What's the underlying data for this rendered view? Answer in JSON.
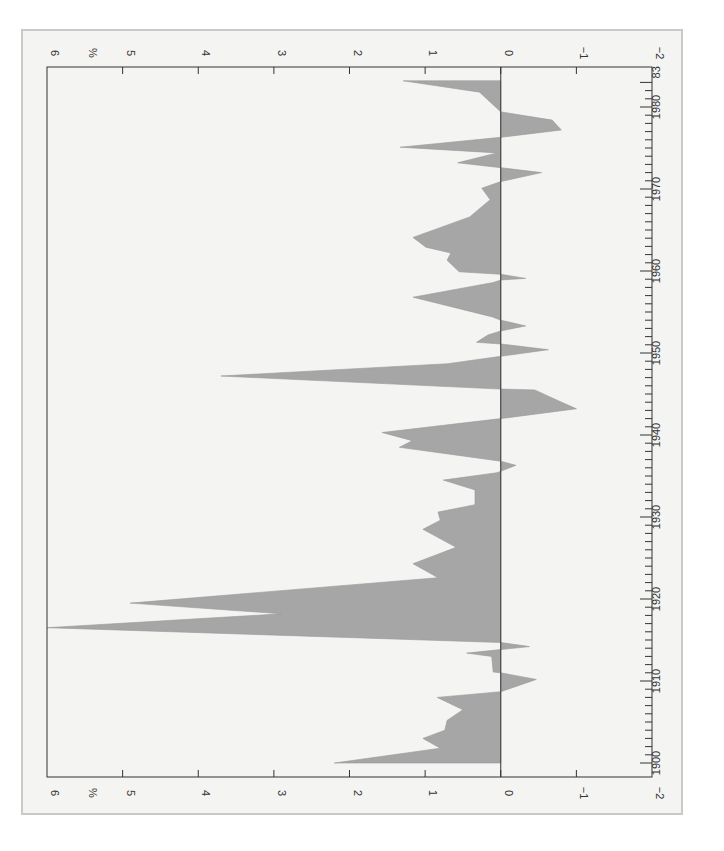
{
  "chart_data": {
    "type": "area",
    "orientation": "rotated-90-clockwise",
    "title": "",
    "xlabel": "",
    "ylabel": "%",
    "x_range": [
      1900,
      1983
    ],
    "ylim": [
      -2,
      6
    ],
    "grid": false,
    "legend": null,
    "value_ticks": [
      "6",
      "%",
      "5",
      "4",
      "3",
      "2",
      "1",
      "0",
      "−1",
      "−2"
    ],
    "value_tick_values": [
      6,
      5,
      4,
      3,
      2,
      1,
      0,
      -1,
      -2
    ],
    "year_tick_labels": [
      "1900",
      "1910",
      "1920",
      "1930",
      "1940",
      "1950",
      "1960",
      "1970",
      "1980",
      "83"
    ],
    "year_tick_values": [
      1900,
      1910,
      1920,
      1930,
      1940,
      1950,
      1960,
      1970,
      1980,
      1983
    ],
    "fill_color": "#a6a6a6",
    "series": [
      {
        "name": "percent",
        "points": [
          [
            1900.0,
            2.2
          ],
          [
            1901.8,
            0.8
          ],
          [
            1903.0,
            1.03
          ],
          [
            1904.0,
            0.74
          ],
          [
            1905.2,
            0.71
          ],
          [
            1906.5,
            0.5
          ],
          [
            1908.0,
            0.84
          ],
          [
            1908.7,
            0.0
          ],
          [
            1910.2,
            -0.47
          ],
          [
            1911.0,
            0.0
          ],
          [
            1911.1,
            0.1
          ],
          [
            1913.0,
            0.12
          ],
          [
            1913.4,
            0.45
          ],
          [
            1914.2,
            -0.38
          ],
          [
            1914.7,
            0.0
          ],
          [
            1916.5,
            6.0
          ],
          [
            1918.2,
            2.9
          ],
          [
            1919.5,
            4.9
          ],
          [
            1922.6,
            0.83
          ],
          [
            1924.3,
            1.16
          ],
          [
            1926.3,
            0.59
          ],
          [
            1928.5,
            1.03
          ],
          [
            1929.6,
            0.8
          ],
          [
            1930.6,
            0.83
          ],
          [
            1931.5,
            0.34
          ],
          [
            1933.3,
            0.34
          ],
          [
            1934.5,
            0.76
          ],
          [
            1935.4,
            0.05
          ],
          [
            1936.3,
            -0.2
          ],
          [
            1936.8,
            0.0
          ],
          [
            1938.5,
            1.34
          ],
          [
            1939.3,
            1.17
          ],
          [
            1940.3,
            1.57
          ],
          [
            1942.0,
            0.0
          ],
          [
            1943.2,
            -1.0
          ],
          [
            1944.3,
            -0.73
          ],
          [
            1945.5,
            -0.45
          ],
          [
            1945.6,
            0.0
          ],
          [
            1947.2,
            3.7
          ],
          [
            1948.7,
            0.7
          ],
          [
            1949.6,
            0.0
          ],
          [
            1950.4,
            -0.63
          ],
          [
            1951.1,
            0.0
          ],
          [
            1951.3,
            0.32
          ],
          [
            1952.2,
            0.17
          ],
          [
            1952.7,
            0.0
          ],
          [
            1953.3,
            -0.33
          ],
          [
            1954.0,
            0.0
          ],
          [
            1954.4,
            0.11
          ],
          [
            1956.8,
            1.16
          ],
          [
            1958.6,
            0.1
          ],
          [
            1958.9,
            0.0
          ],
          [
            1959.1,
            -0.33
          ],
          [
            1959.6,
            0.0
          ],
          [
            1959.9,
            0.55
          ],
          [
            1961.3,
            0.71
          ],
          [
            1962.2,
            0.66
          ],
          [
            1962.9,
            0.99
          ],
          [
            1964.1,
            1.16
          ],
          [
            1966.6,
            0.41
          ],
          [
            1968.7,
            0.14
          ],
          [
            1970.1,
            0.25
          ],
          [
            1970.9,
            0.0
          ],
          [
            1972.0,
            -0.54
          ],
          [
            1972.6,
            0.0
          ],
          [
            1973.2,
            0.57
          ],
          [
            1974.4,
            0.05
          ],
          [
            1975.1,
            1.33
          ],
          [
            1976.3,
            0.0
          ],
          [
            1977.2,
            -0.8
          ],
          [
            1978.4,
            -0.68
          ],
          [
            1979.4,
            0.0
          ],
          [
            1981.8,
            0.28
          ],
          [
            1983.2,
            1.29
          ]
        ]
      }
    ]
  }
}
